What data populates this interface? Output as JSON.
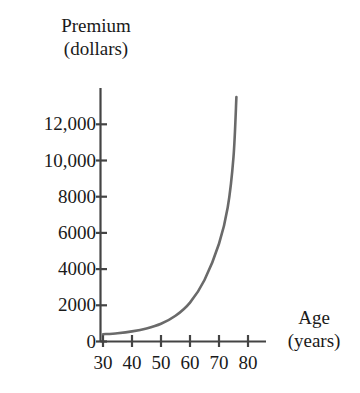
{
  "chart_data": {
    "type": "line",
    "title": "",
    "subtitle": "",
    "xlabel_line1": "Age",
    "xlabel_line2": "(years)",
    "ylabel_line1": "Premium",
    "ylabel_line2": "(dollars)",
    "xlabel": "Age (years)",
    "ylabel": "Premium (dollars)",
    "xlim": [
      28,
      85
    ],
    "ylim": [
      0,
      13800
    ],
    "grid": false,
    "legend": null,
    "legend_position": "none",
    "xticks": [
      30,
      40,
      50,
      60,
      70,
      80
    ],
    "xtick_labels": [
      "30",
      "40",
      "50",
      "60",
      "70",
      "80"
    ],
    "yticks": [
      0,
      2000,
      4000,
      6000,
      8000,
      10000,
      12000
    ],
    "ytick_labels": [
      "0",
      "2000",
      "4000",
      "6000",
      "8000",
      "10,000",
      "12,000"
    ],
    "series": [
      {
        "name": "Premium",
        "color": "#6a6a6a",
        "x": [
          30,
          35,
          40,
          45,
          50,
          55,
          60,
          65,
          70,
          73,
          75,
          76
        ],
        "values": [
          400,
          460,
          560,
          720,
          980,
          1420,
          2150,
          3400,
          5400,
          7400,
          10200,
          13500
        ]
      }
    ],
    "annotations": []
  },
  "style": {
    "curve_color": "#6a6a6a",
    "axis_color": "#444444",
    "text_color": "#1a1a1a",
    "background": "#ffffff"
  },
  "icons": {
    "y_axis": "vertical-axis-line",
    "x_axis": "horizontal-axis-line"
  }
}
